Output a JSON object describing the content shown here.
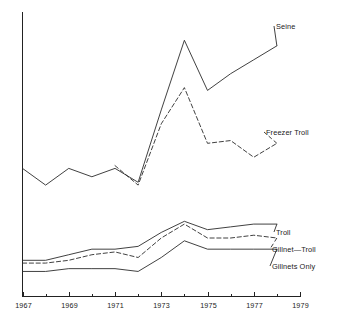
{
  "chart_data": {
    "type": "line",
    "title": "",
    "subtitle": "",
    "xlabel": "",
    "ylabel": "",
    "xlim": [
      1967,
      1979
    ],
    "ylim": [
      0,
      100
    ],
    "grid": false,
    "legend_position": "right-inline-labels",
    "x_tick_labels": [
      "1967",
      "1969",
      "1971",
      "1973",
      "1975",
      "1977",
      "1979"
    ],
    "x_ticks_major": [
      1967,
      1969,
      1971,
      1973,
      1975,
      1977,
      1979
    ],
    "x_ticks_minor": [
      1968,
      1970,
      1972,
      1974,
      1976,
      1978
    ],
    "y_tick_labels": [],
    "series": [
      {
        "name": "Seine",
        "style": "solid",
        "x": [
          1967,
          1968,
          1969,
          1970,
          1971,
          1972,
          1973,
          1974,
          1975,
          1976,
          1977,
          1978
        ],
        "values": [
          46,
          40,
          46,
          43,
          46,
          41,
          67,
          92,
          74,
          80,
          85,
          90
        ]
      },
      {
        "name": "Freezer Troll",
        "style": "dashed",
        "x": [
          1971,
          1972,
          1973,
          1974,
          1975,
          1976,
          1977,
          1978
        ],
        "values": [
          47,
          40,
          62,
          75,
          55,
          56,
          50,
          55
        ]
      },
      {
        "name": "Troll",
        "style": "solid",
        "x": [
          1967,
          1968,
          1969,
          1970,
          1971,
          1972,
          1973,
          1974,
          1975,
          1976,
          1977,
          1978
        ],
        "values": [
          13,
          13,
          15,
          17,
          17,
          18,
          23,
          27,
          24,
          25,
          26,
          26
        ]
      },
      {
        "name": "Gillnet—Troll",
        "style": "dashed",
        "x": [
          1967,
          1968,
          1969,
          1970,
          1971,
          1972,
          1973,
          1974,
          1975,
          1976,
          1977,
          1978
        ],
        "values": [
          12,
          12,
          13,
          15,
          16,
          14,
          21,
          26,
          21,
          21,
          22,
          21
        ]
      },
      {
        "name": "Gillnets Only",
        "style": "solid",
        "x": [
          1967,
          1968,
          1969,
          1970,
          1971,
          1972,
          1973,
          1974,
          1975,
          1976,
          1977,
          1978
        ],
        "values": [
          9,
          9,
          10,
          10,
          10,
          9,
          14,
          20,
          17,
          17,
          17,
          17
        ]
      }
    ],
    "series_labels": [
      {
        "name": "Seine",
        "label": "Seine",
        "style": "solid"
      },
      {
        "name": "Freezer Troll",
        "label": "Freezer Troll",
        "style": "dashed"
      },
      {
        "name": "Troll",
        "label": "Troll",
        "style": "solid"
      },
      {
        "name": "Gillnet—Troll",
        "label": "Gillnet—Troll",
        "style": "dashed"
      },
      {
        "name": "Gillnets Only",
        "label": "Gillnets Only",
        "style": "solid"
      }
    ],
    "colors": {
      "line": "#2b2b2b",
      "axis": "#222222",
      "background": "#ffffff",
      "text": "#1a1a1a"
    }
  }
}
